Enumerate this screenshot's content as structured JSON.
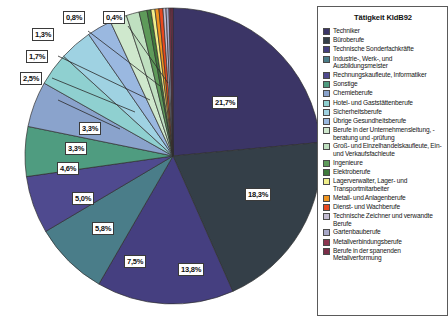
{
  "chart_data": {
    "type": "pie",
    "title": "Tätigkeit KldB92",
    "legend_position": "right",
    "grid": false,
    "value_unit": "%",
    "decimal_separator": ",",
    "categories": [
      "Techniker",
      "Büroberufe",
      "Technische Sonderfachkräfte",
      "Industrie-, Werk-, und Ausbildungsmeister",
      "Rechnungskaufleute, Informatiker",
      "Sonstige",
      "Chemieberufe",
      "Hotel- und Gaststättenberufe",
      "Sicherheitsberufe",
      "Übrige Gesundheitsberufe",
      "Berufe in der Unternehmensleitung, -beratung und -prüfung",
      "Groß- und Einzelhandelskaufleute, Ein- und Verkaufsfachleute",
      "Ingenieure",
      "Elektroberufe",
      "Lagerverwalter, Lager- und Transportmitarbeiter",
      "Metall- und Anlagenberufe",
      "Dienst- und Wachberufe",
      "Technische Zeichner und verwandte Berufe",
      "Gartenbauberufe",
      "Metallverbindungsberufe",
      "Berufe in der spanenden Metallverformung"
    ],
    "values": [
      21.7,
      18.3,
      13.8,
      7.5,
      5.8,
      5.0,
      4.6,
      3.3,
      3.3,
      2.5,
      1.7,
      1.3,
      0.8,
      0.4,
      0.4,
      0.4,
      0.4,
      0.3,
      0.3,
      0.2,
      0.2
    ],
    "colors": [
      "#3b3566",
      "#343f48",
      "#453f80",
      "#4a7d89",
      "#4f4a8f",
      "#4f9c80",
      "#8aa3cc",
      "#8fd0d0",
      "#9fd2e2",
      "#9ab8e0",
      "#cfe8cd",
      "#bfe0c0",
      "#5e9a5a",
      "#3f7a3c",
      "#f0ef8a",
      "#f0951f",
      "#e8491f",
      "#c3bcd2",
      "#a8a8c8",
      "#8c3550",
      "#7b2d48"
    ],
    "labeled_slices": [
      {
        "label": "21,7%",
        "value": 21.7,
        "category": "Techniker"
      },
      {
        "label": "18,3%",
        "value": 18.3,
        "category": "Büroberufe"
      },
      {
        "label": "13,8%",
        "value": 13.8,
        "category": "Technische Sonderfachkräfte"
      },
      {
        "label": "7,5%",
        "value": 7.5,
        "category": "Industrie-, Werk-, und Ausbildungsmeister"
      },
      {
        "label": "5,8%",
        "value": 5.8,
        "category": "Rechnungskaufleute, Informatiker"
      },
      {
        "label": "5,0%",
        "value": 5.0,
        "category": "Sonstige"
      },
      {
        "label": "4,6%",
        "value": 4.6,
        "category": "Chemieberufe"
      },
      {
        "label": "3,3%",
        "value": 3.3,
        "category": "Hotel- und Gaststättenberufe"
      },
      {
        "label": "3,3%",
        "value": 3.3,
        "category": "Sicherheitsberufe"
      },
      {
        "label": "2,5%",
        "value": 2.5,
        "category": "Übrige Gesundheitsberufe"
      },
      {
        "label": "1,7%",
        "value": 1.7,
        "category": "Berufe in der Unternehmensleitung, -beratung und -prüfung"
      },
      {
        "label": "1,3%",
        "value": 1.3,
        "category": "Groß- und Einzelhandelskaufleute, Ein- und Verkaufsfachleute"
      },
      {
        "label": "0,8%",
        "value": 0.8,
        "category": "Ingenieure"
      },
      {
        "label": "0,4%",
        "value": 0.4,
        "category": "Elektroberufe"
      }
    ]
  },
  "legend": {
    "title": "Tätigkeit KldB92"
  }
}
